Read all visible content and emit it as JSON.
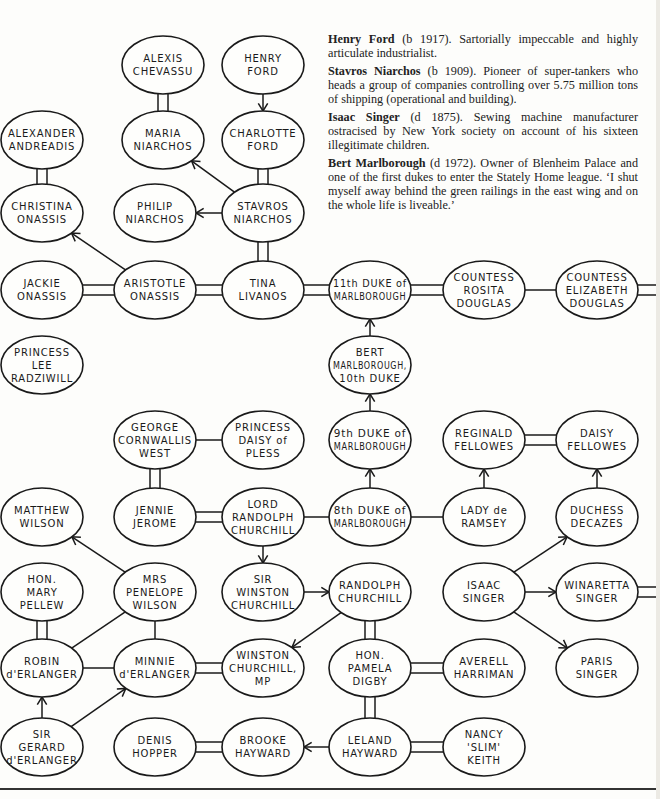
{
  "notes": [
    {
      "name": "Henry Ford",
      "rest": " (b 1917). Sartorially impeccable and highly articulate industrialist."
    },
    {
      "name": "Stavros Niarchos",
      "rest": " (b 1909). Pioneer of super-tankers who heads a group of companies controlling over 5.75 million tons of shipping (operational and building)."
    },
    {
      "name": "Isaac Singer",
      "rest": " (d 1875). Sewing machine manufacturer ostracised by New York society on account of his sixteen illegitimate children."
    },
    {
      "name": "Bert Marlborough",
      "rest": " (d 1972). Owner of Blenheim Palace and one of the first dukes to enter the Stately Home league. ‘I shut myself away behind the green railings in the east wing and on the whole life is liveable.’"
    }
  ],
  "nodes": {
    "alexis_chevassu": {
      "lines": [
        "ALEXIS",
        "CHEVASSU"
      ],
      "x": 163,
      "y": 65
    },
    "henry_ford": {
      "lines": [
        "HENRY",
        "FORD"
      ],
      "x": 263,
      "y": 65
    },
    "alexander_andreadis": {
      "lines": [
        "ALEXANDER",
        "ANDREADIS"
      ],
      "x": 42,
      "y": 140
    },
    "maria_niarchos": {
      "lines": [
        "MARIA",
        "NIARCHOS"
      ],
      "x": 163,
      "y": 140
    },
    "charlotte_ford": {
      "lines": [
        "CHARLOTTE",
        "FORD"
      ],
      "x": 263,
      "y": 140
    },
    "christina_onassis": {
      "lines": [
        "CHRISTINA",
        "ONASSIS"
      ],
      "x": 42,
      "y": 213
    },
    "philip_niarchos": {
      "lines": [
        "PHILIP",
        "NIARCHOS"
      ],
      "x": 155,
      "y": 213
    },
    "stavros_niarchos": {
      "lines": [
        "STAVROS",
        "NIARCHOS"
      ],
      "x": 263,
      "y": 213
    },
    "jackie_onassis": {
      "lines": [
        "JACKIE",
        "ONASSIS"
      ],
      "x": 42,
      "y": 290
    },
    "aristotle_onassis": {
      "lines": [
        "ARISTOTLE",
        "ONASSIS"
      ],
      "x": 155,
      "y": 290
    },
    "tina_livanos": {
      "lines": [
        "TINA",
        "LIVANOS"
      ],
      "x": 263,
      "y": 290
    },
    "duke_11": {
      "lines": [
        "11th DUKE of",
        "MARLBOROUGH"
      ],
      "x": 370,
      "y": 290
    },
    "rosita_douglas": {
      "lines": [
        "COUNTESS",
        "ROSITA",
        "DOUGLAS"
      ],
      "x": 484,
      "y": 290
    },
    "elizabeth_douglas": {
      "lines": [
        "COUNTESS",
        "ELIZABETH",
        "DOUGLAS"
      ],
      "x": 597,
      "y": 290
    },
    "lee_radziwill": {
      "lines": [
        "PRINCESS",
        "LEE",
        "RADZIWILL"
      ],
      "x": 42,
      "y": 365
    },
    "bert_marlborough": {
      "lines": [
        "BERT",
        "MARLBOROUGH,",
        "10th DUKE"
      ],
      "x": 370,
      "y": 365
    },
    "george_cornwallis_west": {
      "lines": [
        "GEORGE",
        "CORNWALLIS",
        "WEST"
      ],
      "x": 155,
      "y": 440
    },
    "daisy_of_pless": {
      "lines": [
        "PRINCESS",
        "DAISY of",
        "PLESS"
      ],
      "x": 263,
      "y": 440
    },
    "duke_9": {
      "lines": [
        "9th DUKE of",
        "MARLBOROUGH"
      ],
      "x": 370,
      "y": 440
    },
    "reginald_fellowes": {
      "lines": [
        "REGINALD",
        "FELLOWES"
      ],
      "x": 484,
      "y": 440
    },
    "daisy_fellowes": {
      "lines": [
        "DAISY",
        "FELLOWES"
      ],
      "x": 597,
      "y": 440
    },
    "matthew_wilson": {
      "lines": [
        "MATTHEW",
        "WILSON"
      ],
      "x": 42,
      "y": 517
    },
    "jennie_jerome": {
      "lines": [
        "JENNIE",
        "JEROME"
      ],
      "x": 155,
      "y": 517
    },
    "lord_randolph": {
      "lines": [
        "LORD",
        "RANDOLPH",
        "CHURCHILL"
      ],
      "x": 263,
      "y": 517
    },
    "duke_8": {
      "lines": [
        "8th DUKE of",
        "MARLBOROUGH"
      ],
      "x": 370,
      "y": 517
    },
    "lady_de_ramsey": {
      "lines": [
        "LADY de",
        "RAMSEY"
      ],
      "x": 484,
      "y": 517
    },
    "duchess_decazes": {
      "lines": [
        "DUCHESS",
        "DECAZES"
      ],
      "x": 597,
      "y": 517
    },
    "mary_pellew": {
      "lines": [
        "HON.",
        "MARY",
        "PELLEW"
      ],
      "x": 42,
      "y": 592
    },
    "penelope_wilson": {
      "lines": [
        "MRS",
        "PENELOPE",
        "WILSON"
      ],
      "x": 155,
      "y": 592
    },
    "sir_winston": {
      "lines": [
        "SIR",
        "WINSTON",
        "CHURCHILL"
      ],
      "x": 263,
      "y": 592
    },
    "randolph_churchill": {
      "lines": [
        "RANDOLPH",
        "CHURCHILL"
      ],
      "x": 370,
      "y": 592
    },
    "isaac_singer": {
      "lines": [
        "ISAAC",
        "SINGER"
      ],
      "x": 484,
      "y": 592
    },
    "winaretta_singer": {
      "lines": [
        "WINARETTA",
        "SINGER"
      ],
      "x": 597,
      "y": 592
    },
    "robin_derlanger": {
      "lines": [
        "ROBIN",
        "d'ERLANGER"
      ],
      "x": 42,
      "y": 668
    },
    "minnie_derlanger": {
      "lines": [
        "MINNIE",
        "d'ERLANGER"
      ],
      "x": 155,
      "y": 668
    },
    "winston_mp": {
      "lines": [
        "WINSTON",
        "CHURCHILL,",
        "MP"
      ],
      "x": 263,
      "y": 668
    },
    "pamela_digby": {
      "lines": [
        "HON.",
        "PAMELA",
        "DIGBY"
      ],
      "x": 370,
      "y": 668
    },
    "averell_harriman": {
      "lines": [
        "AVERELL",
        "HARRIMAN"
      ],
      "x": 484,
      "y": 668
    },
    "paris_singer": {
      "lines": [
        "PARIS",
        "SINGER"
      ],
      "x": 597,
      "y": 668
    },
    "gerard_derlanger": {
      "lines": [
        "SIR",
        "GERARD",
        "d'ERLANGER"
      ],
      "x": 42,
      "y": 747
    },
    "denis_hopper": {
      "lines": [
        "DENIS",
        "HOPPER"
      ],
      "x": 155,
      "y": 747
    },
    "brooke_hayward": {
      "lines": [
        "BROOKE",
        "HAYWARD"
      ],
      "x": 263,
      "y": 747
    },
    "leland_hayward": {
      "lines": [
        "LELAND",
        "HAYWARD"
      ],
      "x": 370,
      "y": 747
    },
    "nancy_keith": {
      "lines": [
        "NANCY",
        "'SLIM'",
        "KEITH"
      ],
      "x": 484,
      "y": 747
    }
  },
  "edges": [
    {
      "from": "alexis_chevassu",
      "to": "maria_niarchos",
      "type": "marriage"
    },
    {
      "from": "henry_ford",
      "to": "charlotte_ford",
      "type": "child"
    },
    {
      "from": "charlotte_ford",
      "to": "stavros_niarchos",
      "type": "marriage"
    },
    {
      "from": "alexander_andreadis",
      "to": "christina_onassis",
      "type": "marriage"
    },
    {
      "from": "stavros_niarchos",
      "to": "maria_niarchos",
      "type": "child"
    },
    {
      "from": "stavros_niarchos",
      "to": "philip_niarchos",
      "type": "child"
    },
    {
      "from": "stavros_niarchos",
      "to": "tina_livanos",
      "type": "marriage"
    },
    {
      "from": "aristotle_onassis",
      "to": "christina_onassis",
      "type": "child"
    },
    {
      "from": "jackie_onassis",
      "to": "aristotle_onassis",
      "type": "marriage"
    },
    {
      "from": "aristotle_onassis",
      "to": "tina_livanos",
      "type": "marriage"
    },
    {
      "from": "tina_livanos",
      "to": "duke_11",
      "type": "marriage"
    },
    {
      "from": "duke_11",
      "to": "rosita_douglas",
      "type": "marriage"
    },
    {
      "from": "rosita_douglas",
      "to": "elizabeth_douglas",
      "type": "link"
    },
    {
      "from": "elizabeth_douglas",
      "to": "right_edge",
      "type": "marriage"
    },
    {
      "from": "bert_marlborough",
      "to": "duke_11",
      "type": "child"
    },
    {
      "from": "duke_9",
      "to": "bert_marlborough",
      "type": "child"
    },
    {
      "from": "george_cornwallis_west",
      "to": "daisy_of_pless",
      "type": "link"
    },
    {
      "from": "george_cornwallis_west",
      "to": "jennie_jerome",
      "type": "marriage"
    },
    {
      "from": "reginald_fellowes",
      "to": "daisy_fellowes",
      "type": "marriage"
    },
    {
      "from": "jennie_jerome",
      "to": "lord_randolph",
      "type": "marriage"
    },
    {
      "from": "lord_randolph",
      "to": "duke_8",
      "type": "link"
    },
    {
      "from": "duke_8",
      "to": "duke_9",
      "type": "child"
    },
    {
      "from": "duke_8",
      "to": "lady_de_ramsey",
      "type": "link"
    },
    {
      "from": "lady_de_ramsey",
      "to": "reginald_fellowes",
      "type": "child"
    },
    {
      "from": "duchess_decazes",
      "to": "daisy_fellowes",
      "type": "child"
    },
    {
      "from": "lord_randolph",
      "to": "sir_winston",
      "type": "child"
    },
    {
      "from": "penelope_wilson",
      "to": "matthew_wilson",
      "type": "child"
    },
    {
      "from": "sir_winston",
      "to": "randolph_churchill",
      "type": "child"
    },
    {
      "from": "isaac_singer",
      "to": "duchess_decazes",
      "type": "child"
    },
    {
      "from": "isaac_singer",
      "to": "winaretta_singer",
      "type": "child"
    },
    {
      "from": "isaac_singer",
      "to": "paris_singer",
      "type": "child"
    },
    {
      "from": "winaretta_singer",
      "to": "right_edge",
      "type": "marriage"
    },
    {
      "from": "mary_pellew",
      "to": "robin_derlanger",
      "type": "marriage"
    },
    {
      "from": "penelope_wilson",
      "to": "robin_derlanger",
      "type": "link"
    },
    {
      "from": "penelope_wilson",
      "to": "minnie_derlanger",
      "type": "link"
    },
    {
      "from": "randolph_churchill",
      "to": "winston_mp",
      "type": "child"
    },
    {
      "from": "randolph_churchill",
      "to": "pamela_digby",
      "type": "marriage"
    },
    {
      "from": "robin_derlanger",
      "to": "minnie_derlanger",
      "type": "link"
    },
    {
      "from": "minnie_derlanger",
      "to": "winston_mp",
      "type": "marriage"
    },
    {
      "from": "pamela_digby",
      "to": "averell_harriman",
      "type": "marriage"
    },
    {
      "from": "pamela_digby",
      "to": "leland_hayward",
      "type": "marriage"
    },
    {
      "from": "gerard_derlanger",
      "to": "robin_derlanger",
      "type": "child"
    },
    {
      "from": "gerard_derlanger",
      "to": "minnie_derlanger",
      "type": "child"
    },
    {
      "from": "denis_hopper",
      "to": "brooke_hayward",
      "type": "marriage"
    },
    {
      "from": "leland_hayward",
      "to": "brooke_hayward",
      "type": "child"
    },
    {
      "from": "leland_hayward",
      "to": "nancy_keith",
      "type": "marriage"
    }
  ],
  "legend": {
    "marriage": "double line",
    "child": "arrow from parent to child",
    "link": "single line"
  }
}
